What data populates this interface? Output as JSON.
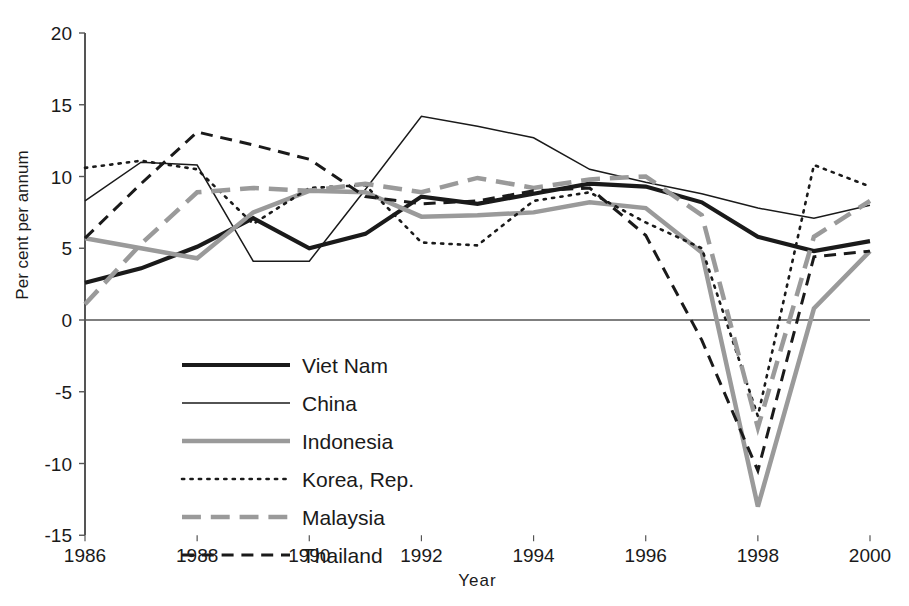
{
  "chart_data": {
    "type": "line",
    "title": "",
    "xlabel": "Year",
    "ylabel": "Per cent per annum",
    "xlim": [
      1986,
      2000
    ],
    "ylim": [
      -15,
      20
    ],
    "yticks": [
      20,
      15,
      10,
      5,
      0,
      -5,
      -10,
      -15
    ],
    "xticks": [
      1986,
      1988,
      1990,
      1992,
      1994,
      1996,
      1998,
      2000
    ],
    "xtick_labels": [
      "1986",
      "1988",
      "1990",
      "1992",
      "1994",
      "1996",
      "1998",
      "2000"
    ],
    "ytick_labels": [
      "20",
      "15",
      "10",
      "5",
      "0",
      "-5",
      "-10",
      "-15"
    ],
    "grid": false,
    "legend_position": "inside-lower-left",
    "x": [
      1986,
      1987,
      1988,
      1989,
      1990,
      1991,
      1992,
      1993,
      1994,
      1995,
      1996,
      1997,
      1998,
      1999,
      2000
    ],
    "series": [
      {
        "name": "Viet Nam",
        "style": "solid",
        "color": "#1a1a1a",
        "width": 4.2,
        "values": [
          2.6,
          3.6,
          5.1,
          7.1,
          5.0,
          6.0,
          8.6,
          8.1,
          8.8,
          9.5,
          9.3,
          8.2,
          5.8,
          4.8,
          5.5
        ]
      },
      {
        "name": "China",
        "style": "solid",
        "color": "#1a1a1a",
        "width": 1.5,
        "values": [
          8.3,
          11.0,
          10.8,
          4.1,
          4.1,
          9.1,
          14.2,
          13.5,
          12.7,
          10.5,
          9.6,
          8.8,
          7.8,
          7.1,
          8.0
        ]
      },
      {
        "name": "Indonesia",
        "style": "solid",
        "color": "#9a9a9a",
        "width": 4.5,
        "values": [
          5.7,
          5.0,
          4.3,
          7.5,
          9.0,
          8.9,
          7.2,
          7.3,
          7.5,
          8.2,
          7.8,
          4.7,
          -13.0,
          0.8,
          4.8
        ]
      },
      {
        "name": "Korea, Rep.",
        "style": "dotted",
        "color": "#1a1a1a",
        "width": 2.6,
        "values": [
          10.6,
          11.1,
          10.5,
          6.7,
          9.2,
          9.4,
          5.4,
          5.2,
          8.3,
          8.9,
          6.8,
          5.0,
          -6.7,
          10.8,
          9.3
        ]
      },
      {
        "name": "Malaysia",
        "style": "dashed-thick",
        "color": "#9a9a9a",
        "width": 4.5,
        "values": [
          1.1,
          5.3,
          8.9,
          9.2,
          9.0,
          9.5,
          8.9,
          9.9,
          9.2,
          9.8,
          10.0,
          7.3,
          -7.5,
          5.8,
          8.3
        ]
      },
      {
        "name": "Thailand",
        "style": "dashed",
        "color": "#1a1a1a",
        "width": 3.0,
        "values": [
          5.7,
          9.5,
          13.1,
          12.2,
          11.2,
          8.6,
          8.1,
          8.3,
          9.0,
          9.2,
          5.9,
          -1.4,
          -10.5,
          4.4,
          4.8
        ]
      }
    ]
  },
  "axis": {
    "y_title": "Per cent per annum",
    "x_title": "Year"
  },
  "legend": {
    "items": [
      {
        "label": "Viet Nam"
      },
      {
        "label": "China"
      },
      {
        "label": "Indonesia"
      },
      {
        "label": "Korea, Rep."
      },
      {
        "label": "Malaysia"
      },
      {
        "label": "Thailand"
      }
    ]
  }
}
